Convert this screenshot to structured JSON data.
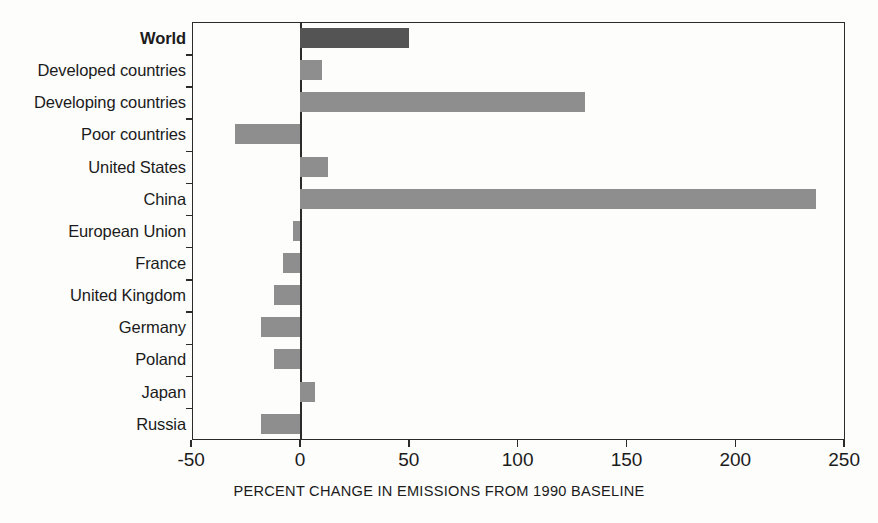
{
  "chart_data": {
    "type": "bar",
    "orientation": "horizontal",
    "title": "",
    "subtitle": "",
    "xlabel": "PERCENT CHANGE IN EMISSIONS FROM 1990 BASELINE",
    "ylabel": "",
    "xlim": [
      -50,
      250
    ],
    "ylim": null,
    "grid": false,
    "legend": null,
    "xticks": [
      -50,
      0,
      50,
      100,
      150,
      200,
      250
    ],
    "xtick_labels": [
      "-50",
      "0",
      "50",
      "100",
      "150",
      "200",
      "250"
    ],
    "categories": [
      "World",
      "Developed countries",
      "Developing countries",
      "Poor countries",
      "United States",
      "China",
      "European Union",
      "France",
      "United Kingdom",
      "Germany",
      "Poland",
      "Japan",
      "Russia"
    ],
    "values": [
      50,
      10,
      131,
      -30,
      13,
      237,
      -3,
      -8,
      -12,
      -18,
      -12,
      7,
      -18
    ],
    "series": [
      {
        "name": "Percent change in emissions from 1990 baseline",
        "values": [
          50,
          10,
          131,
          -30,
          13,
          237,
          -3,
          -8,
          -12,
          -18,
          -12,
          7,
          -18
        ]
      }
    ],
    "bar_colors": [
      "#545454",
      "#8e8e8e",
      "#8e8e8e",
      "#8e8e8e",
      "#8e8e8e",
      "#8e8e8e",
      "#8e8e8e",
      "#8e8e8e",
      "#8e8e8e",
      "#8e8e8e",
      "#8e8e8e",
      "#8e8e8e",
      "#8e8e8e"
    ],
    "emphasized_categories": [
      "World"
    ],
    "axis_color": "#2b2b2b",
    "background_color": "#fdfdfb"
  }
}
